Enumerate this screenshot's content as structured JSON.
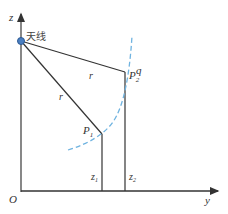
{
  "diagram": {
    "axes": {
      "z_label": "z",
      "y_label": "y",
      "origin_label": "O"
    },
    "antenna": {
      "label": "天线",
      "color": "#4a7fc1"
    },
    "rays": [
      {
        "label": "r",
        "to": "P2"
      },
      {
        "label": "r",
        "to": "P1"
      }
    ],
    "points": [
      {
        "name": "P1",
        "base": "P",
        "sub": "1",
        "height_label_base": "z",
        "height_label_sub": "1"
      },
      {
        "name": "P2",
        "base": "P",
        "sub": "2",
        "height_label_base": "z",
        "height_label_sub": "2"
      }
    ],
    "arc": {
      "label": "q",
      "color": "#6fb3e0"
    },
    "colors": {
      "line": "#333333",
      "arc": "#6fb3e0",
      "antenna": "#4a7fc1"
    }
  }
}
